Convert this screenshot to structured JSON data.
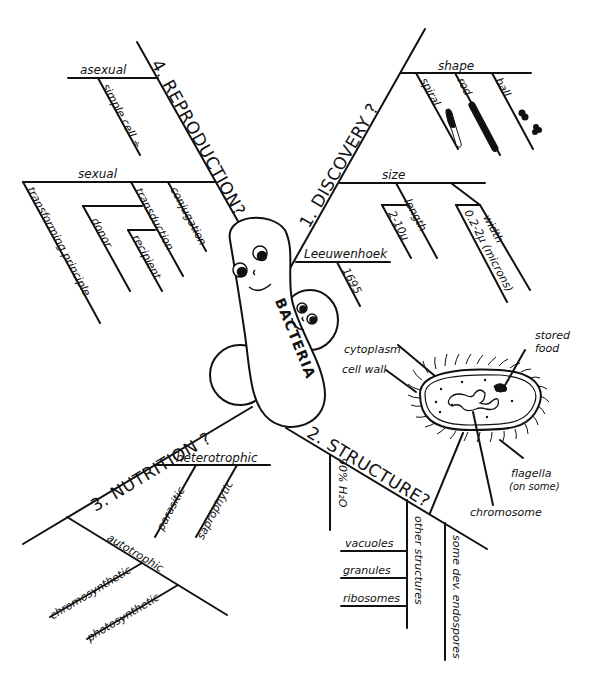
{
  "center": {
    "label": "BACTERIA"
  },
  "branches": {
    "discovery": {
      "title": "1. DISCOVERY ?",
      "shape": {
        "label": "shape",
        "items": [
          "spiral",
          "rod",
          "ball"
        ]
      },
      "size": {
        "label": "size",
        "length": {
          "label": "length",
          "value": "2-10μ"
        },
        "width": {
          "label": "width",
          "value": "0.2-2μ (microns)"
        }
      },
      "discoverer": {
        "label": "Leeuwenhoek",
        "year": "1695"
      }
    },
    "structure": {
      "title": "2. STRUCTURE?",
      "water": "90% H₂O",
      "other": {
        "label": "other structures",
        "items": [
          "vacuoles",
          "granules",
          "ribosomes"
        ]
      },
      "endospores": "some dev. endospores",
      "cell_diagram": {
        "labels": {
          "cytoplasm": "cytoplasm",
          "cell_wall": "cell wall",
          "stored_food": "stored food",
          "flagella": "flagella",
          "flagella_note": "(on some)",
          "chromosome": "chromosome"
        }
      }
    },
    "nutrition": {
      "title": "3. NUTRITION ?",
      "heterotrophic": {
        "label": "heterotrophic",
        "items": [
          "parasitic",
          "saprophytic"
        ]
      },
      "autotrophic": {
        "label": "autotrophic",
        "items": [
          "chromosynthetic",
          "photosynthetic"
        ]
      }
    },
    "reproduction": {
      "title": "4. REPRODUCTION?",
      "asexual": {
        "label": "asexual",
        "items": [
          "simple cell ÷"
        ]
      },
      "sexual": {
        "label": "sexual",
        "items": [
          "transforming principle",
          "transduction",
          "donor",
          "recipient",
          "conjugation"
        ]
      }
    }
  }
}
